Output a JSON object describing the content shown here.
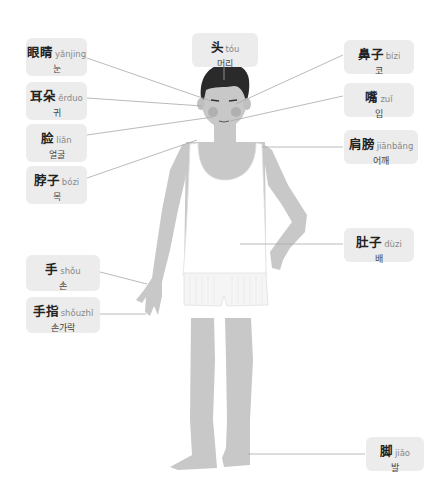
{
  "colors": {
    "label_bg": "#ececec",
    "skin": "#c8c8c8",
    "hair": "#2a2a2a",
    "cheek": "#b0b0b0",
    "clothing": "#ffffff",
    "leader_line": "#a8a8a8"
  },
  "labels": [
    {
      "id": "eyes",
      "zh": "眼睛",
      "pinyin": "yǎnjing",
      "ko": "눈"
    },
    {
      "id": "ears",
      "zh": "耳朵",
      "pinyin": "ěrduo",
      "ko": "귀"
    },
    {
      "id": "face",
      "zh": "脸",
      "pinyin": "liǎn",
      "ko": "얼굴"
    },
    {
      "id": "neck",
      "zh": "脖子",
      "pinyin": "bózi",
      "ko": "목"
    },
    {
      "id": "head",
      "zh": "头",
      "pinyin": "tóu",
      "ko": "머리"
    },
    {
      "id": "nose",
      "zh": "鼻子",
      "pinyin": "bízi",
      "ko": "코"
    },
    {
      "id": "mouth",
      "zh": "嘴",
      "pinyin": "zuǐ",
      "ko": "입"
    },
    {
      "id": "shoulder",
      "zh": "肩膀",
      "pinyin": "jiānbǎng",
      "ko": "어깨"
    },
    {
      "id": "belly",
      "zh": "肚子",
      "pinyin": "dùzi",
      "ko": "배"
    },
    {
      "id": "hand",
      "zh": "手",
      "pinyin": "shǒu",
      "ko": "손"
    },
    {
      "id": "finger",
      "zh": "手指",
      "pinyin": "shǒuzhǐ",
      "ko": "손가락"
    },
    {
      "id": "foot",
      "zh": "脚",
      "pinyin": "jiǎo",
      "ko": "발"
    }
  ]
}
